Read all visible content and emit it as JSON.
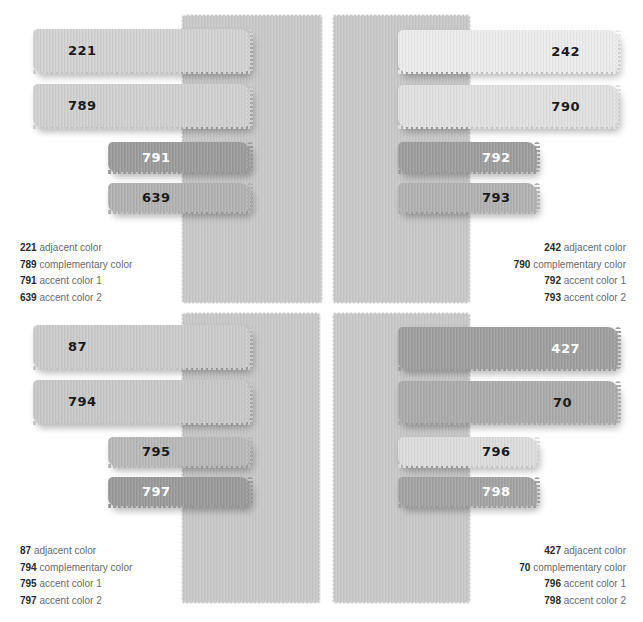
{
  "panels": [
    {
      "id": "top-left",
      "background_color": "#c9c9c9",
      "swatches": [
        {
          "code": "221",
          "role": "adjacent color",
          "color": "#d2d2d2",
          "text_color": "#1a1a1a"
        },
        {
          "code": "789",
          "role": "complementary color",
          "color": "#d0d0d0",
          "text_color": "#1a1a1a"
        },
        {
          "code": "791",
          "role": "accent color 1",
          "color": "#9b9b9b",
          "text_color": "#ffffff"
        },
        {
          "code": "639",
          "role": "accent color 2",
          "color": "#b2b2b2",
          "text_color": "#1a1a1a"
        }
      ],
      "legend": [
        {
          "code": "221",
          "label": "adjacent color"
        },
        {
          "code": "789",
          "label": "complementary color"
        },
        {
          "code": "791",
          "label": "accent color 1"
        },
        {
          "code": "639",
          "label": "accent color 2"
        }
      ]
    },
    {
      "id": "top-right",
      "background_color": "#c9c9c9",
      "swatches": [
        {
          "code": "242",
          "role": "adjacent color",
          "color": "#ececec",
          "text_color": "#1a1a1a"
        },
        {
          "code": "790",
          "role": "complementary color",
          "color": "#e0e0e0",
          "text_color": "#1a1a1a"
        },
        {
          "code": "792",
          "role": "accent color 1",
          "color": "#9d9d9d",
          "text_color": "#ffffff"
        },
        {
          "code": "793",
          "role": "accent color 2",
          "color": "#b1b1b1",
          "text_color": "#1a1a1a"
        }
      ],
      "legend": [
        {
          "code": "242",
          "label": "adjacent color"
        },
        {
          "code": "790",
          "label": "complementary color"
        },
        {
          "code": "792",
          "label": "accent color 1"
        },
        {
          "code": "793",
          "label": "accent color 2"
        }
      ]
    },
    {
      "id": "bottom-left",
      "background_color": "#c9c9c9",
      "swatches": [
        {
          "code": "87",
          "role": "adjacent color",
          "color": "#cbcbcb",
          "text_color": "#1a1a1a"
        },
        {
          "code": "794",
          "role": "complementary color",
          "color": "#c8c8c8",
          "text_color": "#1a1a1a"
        },
        {
          "code": "795",
          "role": "accent color 1",
          "color": "#b8b8b8",
          "text_color": "#1a1a1a"
        },
        {
          "code": "797",
          "role": "accent color 2",
          "color": "#9a9a9a",
          "text_color": "#ffffff"
        }
      ],
      "legend": [
        {
          "code": "87",
          "label": "adjacent color"
        },
        {
          "code": "794",
          "label": "complementary color"
        },
        {
          "code": "795",
          "label": "accent color 1"
        },
        {
          "code": "797",
          "label": "accent color 2"
        }
      ]
    },
    {
      "id": "bottom-right",
      "background_color": "#c9c9c9",
      "swatches": [
        {
          "code": "427",
          "role": "adjacent color",
          "color": "#9e9e9e",
          "text_color": "#ffffff"
        },
        {
          "code": "70",
          "role": "complementary color",
          "color": "#ababab",
          "text_color": "#1a1a1a"
        },
        {
          "code": "796",
          "role": "accent color 1",
          "color": "#dcdcdc",
          "text_color": "#1a1a1a"
        },
        {
          "code": "798",
          "role": "accent color 2",
          "color": "#a3a3a3",
          "text_color": "#ffffff"
        }
      ],
      "legend": [
        {
          "code": "427",
          "label": "adjacent color"
        },
        {
          "code": "70",
          "label": "complementary color"
        },
        {
          "code": "796",
          "label": "accent color 1"
        },
        {
          "code": "798",
          "label": "accent color 2"
        }
      ]
    }
  ]
}
